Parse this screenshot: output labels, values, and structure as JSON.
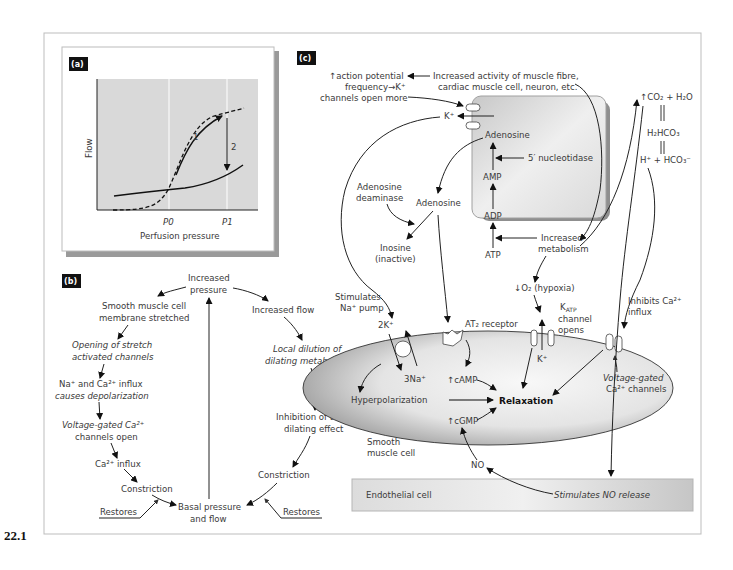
{
  "figure_number": "22.1",
  "panel_a": {
    "label": "(a)",
    "y_axis_label": "Flow",
    "x_axis_label": "Perfusion pressure",
    "ticks": [
      "P0",
      "P1"
    ],
    "arrow_labels": [
      "1",
      "2"
    ]
  },
  "panel_b": {
    "label": "(b)",
    "nodes": {
      "increased_pressure": [
        "Increased",
        "pressure"
      ],
      "membrane_stretched": [
        "Smooth muscle cell",
        "membrane stretched"
      ],
      "stretch_channels": [
        "Opening of stretch",
        "activated channels"
      ],
      "influx_depolarization": [
        "Na⁺ and Ca²⁺ influx",
        "causes depolarization"
      ],
      "vg_ca_open": [
        "Voltage-gated Ca²⁺",
        "channels open"
      ],
      "ca_influx": "Ca²⁺ influx",
      "constriction_left": "Constriction",
      "basal": [
        "Basal pressure",
        "and flow"
      ],
      "restores_left": "Restores",
      "increased_flow": "Increased flow",
      "local_dilution": [
        "Local dilution of",
        "dilating metabolites"
      ],
      "inhibition": [
        "Inhibition of tonic",
        "dilating effect"
      ],
      "constriction_right": "Constriction",
      "restores_right": "Restores"
    }
  },
  "panel_c": {
    "label": "(c)",
    "texts": {
      "ap_frequency": [
        "↑action potential",
        "frequency→K⁺",
        "channels open more"
      ],
      "increased_activity": [
        "Increased activity of muscle fibre,",
        "cardiac muscle cell, neuron, etc."
      ],
      "k_plus_top": "K⁺",
      "adenosine_in": "Adenosine",
      "nucleotidase": "5′ nucleotidase",
      "amp": "AMP",
      "adp": "ADP",
      "atp": "ATP",
      "increased_metabolism": [
        "Increased",
        "metabolism"
      ],
      "adenosine_deaminase": [
        "Adenosine",
        "deaminase"
      ],
      "adenosine_out": "Adenosine",
      "inosine": [
        "Inosine",
        "(inactive)"
      ],
      "co2_h2o": "↑CO₂ + H₂O",
      "h2hco3": "H₂HCO₃",
      "h_hco3": "H⁺ + HCO₃⁻",
      "hypoxia": "↓O₂ (hypoxia)",
      "katp": [
        "K",
        "ATP",
        "channel",
        "opens"
      ],
      "inhibits_ca": [
        "Inhibits Ca²⁺",
        "influx"
      ],
      "stimulates_na_pump": [
        "Stimulates",
        "Na⁺ pump"
      ],
      "two_k": "2K⁺",
      "three_na": "3Na⁺",
      "at2_receptor": "AT₂ receptor",
      "camp": "↑cAMP",
      "cgmp": "↑cGMP",
      "hyperpolarization": "Hyperpolarization",
      "relaxation": "Relaxation",
      "k_plus_katp": "K⁺",
      "vg_ca_channels": [
        "Voltage-gated",
        "Ca²⁺ channels"
      ],
      "smooth_muscle_cell": [
        "Smooth",
        "muscle cell"
      ],
      "no": "NO",
      "endothelial_cell": "Endothelial cell",
      "stimulates_no": "Stimulates NO release"
    }
  },
  "colors": {
    "plot_bg": "#d9d9d9",
    "label_bg": "#111111",
    "cell_fill_dark": "#a8a8a8",
    "cell_fill_light": "#f4f4f4",
    "frame": "#bdbdbd"
  }
}
